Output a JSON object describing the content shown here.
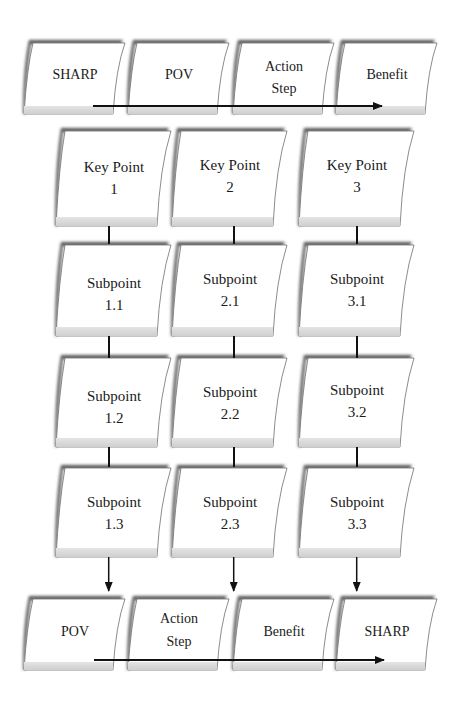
{
  "top_row": {
    "cards": [
      {
        "label": "SHARP"
      },
      {
        "label": "POV"
      },
      {
        "label": "Action\nStep"
      },
      {
        "label": "Benefit"
      }
    ]
  },
  "grid": {
    "columns": [
      {
        "key_point": "Key Point\n1",
        "subpoints": [
          "Subpoint\n1.1",
          "Subpoint\n1.2",
          "Subpoint\n1.3"
        ]
      },
      {
        "key_point": "Key Point\n2",
        "subpoints": [
          "Subpoint\n2.1",
          "Subpoint\n2.2",
          "Subpoint\n2.3"
        ]
      },
      {
        "key_point": "Key Point\n3",
        "subpoints": [
          "Subpoint\n3.1",
          "Subpoint\n3.2",
          "Subpoint\n3.3"
        ]
      }
    ]
  },
  "bottom_row": {
    "cards": [
      {
        "label": "POV"
      },
      {
        "label": "Action\nStep"
      },
      {
        "label": "Benefit"
      },
      {
        "label": "SHARP"
      }
    ]
  },
  "colors": {
    "card_fill": "#ffffff",
    "card_stroke": "#6e6e6e",
    "shadow": "#5a5a5a",
    "footer_band": "#d8d8d8",
    "arrow": "#111111",
    "text": "#1a1a1a"
  }
}
